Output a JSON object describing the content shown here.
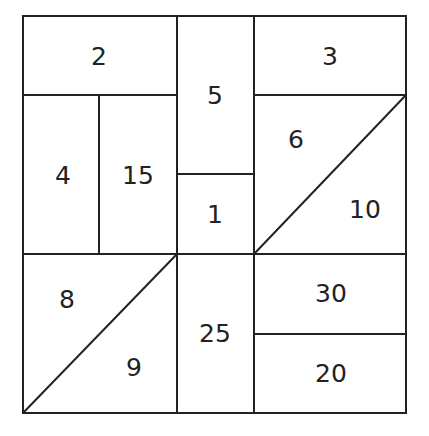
{
  "diagram": {
    "type": "area-partition-puzzle",
    "stroke_color": "#222222",
    "background": "#ffffff",
    "regions": [
      {
        "id": "r2",
        "label": "2"
      },
      {
        "id": "r5",
        "label": "5"
      },
      {
        "id": "r3",
        "label": "3"
      },
      {
        "id": "r4",
        "label": "4"
      },
      {
        "id": "r15",
        "label": "15"
      },
      {
        "id": "r1",
        "label": "1"
      },
      {
        "id": "r6",
        "label": "6"
      },
      {
        "id": "r10",
        "label": "10"
      },
      {
        "id": "r8",
        "label": "8"
      },
      {
        "id": "r9",
        "label": "9"
      },
      {
        "id": "r25",
        "label": "25"
      },
      {
        "id": "r30",
        "label": "30"
      },
      {
        "id": "r20",
        "label": "20"
      }
    ]
  }
}
